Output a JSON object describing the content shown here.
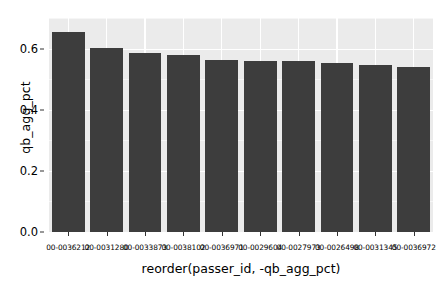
{
  "chart_data": {
    "type": "bar",
    "title": "",
    "xlabel": "reorder(passer_id, -qb_agg_pct)",
    "ylabel": "qb_agg_pct",
    "categories": [
      "00-0036212",
      "00-0031280",
      "00-0033873",
      "00-0038102",
      "00-0036971",
      "00-0029604",
      "00-0027973",
      "00-0026498",
      "00-0031345",
      "00-0036972"
    ],
    "values": [
      0.655,
      0.603,
      0.584,
      0.578,
      0.563,
      0.56,
      0.559,
      0.552,
      0.546,
      0.541
    ],
    "ylim": [
      0.0,
      0.7
    ],
    "y_ticks": [
      "0.0",
      "0.2",
      "0.4",
      "0.6"
    ],
    "y_tick_values": [
      0.0,
      0.2,
      0.4,
      0.6
    ],
    "y_minor_tick_values": [
      0.1,
      0.3,
      0.5,
      0.7
    ],
    "grid": true,
    "legend": "none",
    "panel_background": "#ebebeb",
    "bar_color": "#3d3d3d",
    "grid_color": "#ffffff"
  }
}
